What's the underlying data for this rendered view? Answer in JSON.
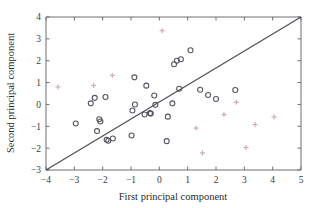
{
  "chart_data": {
    "type": "scatter",
    "title": "",
    "xlabel": "First principal component",
    "ylabel": "Second principal component",
    "xlim": [
      -4,
      5
    ],
    "ylim": [
      -3,
      4
    ],
    "xticks": [
      -4,
      -3,
      -2,
      -1,
      0,
      1,
      2,
      3,
      4,
      5
    ],
    "yticks": [
      -3,
      -2,
      -1,
      0,
      1,
      2,
      3,
      4
    ],
    "xtick_labels": [
      "−4",
      "−3",
      "−2",
      "−1",
      "0",
      "1",
      "2",
      "3",
      "4",
      "5"
    ],
    "ytick_labels": [
      "−3",
      "−2",
      "−1",
      "0",
      "1",
      "2",
      "3",
      "4"
    ],
    "grid": false,
    "legend": "none",
    "colors": {
      "circle_marker": "#5a5560",
      "plus_marker": "#c9a8b4",
      "reference_line": "#4a4a52",
      "axis": "#6e6e76",
      "background": "#ffffff"
    },
    "annotations": [
      {
        "name": "identity-reference-line",
        "type": "line",
        "from": [
          -4,
          -3
        ],
        "to": [
          5,
          4
        ],
        "description": "diagonal reference line with slope 1"
      }
    ],
    "series": [
      {
        "name": "circles",
        "marker": "o",
        "color": "#5a5560",
        "points": [
          [
            -2.95,
            -0.87
          ],
          [
            -2.42,
            0.05
          ],
          [
            -2.28,
            0.3
          ],
          [
            -2.2,
            -1.22
          ],
          [
            -2.12,
            -0.68
          ],
          [
            -2.08,
            -0.78
          ],
          [
            -1.9,
            0.34
          ],
          [
            -1.86,
            -1.62
          ],
          [
            -1.8,
            -1.66
          ],
          [
            -1.64,
            -1.56
          ],
          [
            -0.98,
            -1.42
          ],
          [
            -0.95,
            -0.28
          ],
          [
            -0.88,
            1.24
          ],
          [
            -0.86,
            0.0
          ],
          [
            -0.52,
            -0.46
          ],
          [
            -0.46,
            0.86
          ],
          [
            -0.33,
            -0.4
          ],
          [
            -0.3,
            -0.42
          ],
          [
            -0.18,
            0.41
          ],
          [
            -0.14,
            -0.02
          ],
          [
            0.26,
            -1.68
          ],
          [
            0.3,
            -0.56
          ],
          [
            0.46,
            0.05
          ],
          [
            0.52,
            1.84
          ],
          [
            0.62,
            2.0
          ],
          [
            0.7,
            0.72
          ],
          [
            0.76,
            2.07
          ],
          [
            1.1,
            2.48
          ],
          [
            1.44,
            0.67
          ],
          [
            1.72,
            0.43
          ],
          [
            2.0,
            0.25
          ],
          [
            2.68,
            0.66
          ]
        ]
      },
      {
        "name": "plus-markers",
        "marker": "+",
        "color": "#c9a8b4",
        "points": [
          [
            -3.58,
            0.8
          ],
          [
            -2.32,
            0.87
          ],
          [
            -1.66,
            1.33
          ],
          [
            0.1,
            3.37
          ],
          [
            1.3,
            -1.08
          ],
          [
            1.52,
            -2.22
          ],
          [
            2.28,
            -0.47
          ],
          [
            2.72,
            0.1
          ],
          [
            3.06,
            -1.97
          ],
          [
            3.38,
            -0.92
          ],
          [
            4.05,
            -0.57
          ]
        ]
      }
    ]
  },
  "axes": {
    "x_title": "First principal component",
    "y_title": "Second principal component"
  }
}
